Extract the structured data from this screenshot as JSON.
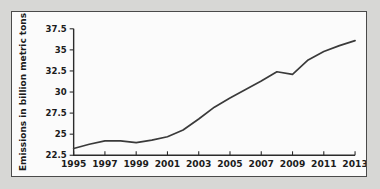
{
  "chart_data": {
    "type": "line",
    "title": "",
    "xlabel": "",
    "ylabel": "Emissions in billion metric tons",
    "x": [
      1995,
      1996,
      1997,
      1998,
      1999,
      2000,
      2001,
      2002,
      2003,
      2004,
      2005,
      2006,
      2007,
      2008,
      2009,
      2010,
      2011,
      2012,
      2013
    ],
    "values": [
      23.3,
      23.8,
      24.2,
      24.2,
      24.0,
      24.3,
      24.7,
      25.5,
      26.8,
      28.2,
      29.3,
      30.3,
      31.3,
      32.4,
      32.1,
      33.8,
      34.8,
      35.5,
      36.1
    ],
    "categories": [
      "1995",
      "1996",
      "1997",
      "1998",
      "1999",
      "2000",
      "2001",
      "2002",
      "2003",
      "2004",
      "2005",
      "2006",
      "2007",
      "2008",
      "2009",
      "2010",
      "2011",
      "2012",
      "2013"
    ],
    "xtick_labels": [
      "1995",
      "1997",
      "1999",
      "2001",
      "2003",
      "2005",
      "2007",
      "2009",
      "2011",
      "2013"
    ],
    "xtick_values": [
      1995,
      1997,
      1999,
      2001,
      2003,
      2005,
      2007,
      2009,
      2011,
      2013
    ],
    "ytick_labels": [
      "22.5",
      "25",
      "27.5",
      "30",
      "32.5",
      "35",
      "37.5"
    ],
    "ytick_values": [
      22.5,
      25,
      27.5,
      30,
      32.5,
      35,
      37.5
    ],
    "xlim": [
      1995,
      2013
    ],
    "ylim": [
      22.5,
      37.5
    ],
    "grid": false,
    "legend": null,
    "series_color": "#3a3a3a",
    "background_color": "#fbfbfb",
    "frame_color": "#4a4a4a"
  }
}
